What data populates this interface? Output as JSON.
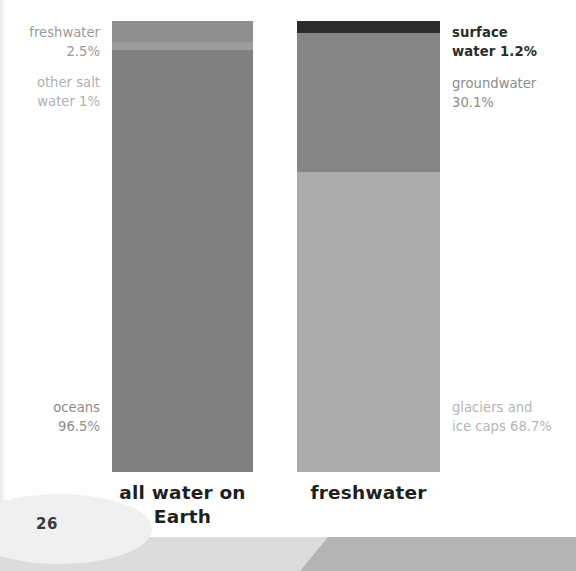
{
  "page": {
    "number": "26"
  },
  "chart_data": {
    "type": "bar",
    "title": "",
    "subtitle": "",
    "xlabel": "",
    "ylabel": "",
    "grid": false,
    "legend_position": "inline-labels",
    "orientation": "vertical-stacked",
    "ylim": [
      0,
      100
    ],
    "units": "percent",
    "categories": [
      "all water on Earth",
      "freshwater"
    ],
    "series": [
      {
        "name": "all water on Earth",
        "segments": [
          {
            "label": "freshwater",
            "value_label": "2.5%",
            "value": 2.5,
            "color": "#8f8f8f"
          },
          {
            "label": "other salt water",
            "value_label": "1%",
            "value": 1.0,
            "color": "#9a9a9a"
          },
          {
            "label": "oceans",
            "value_label": "96.5%",
            "value": 96.5,
            "color": "#808080"
          }
        ]
      },
      {
        "name": "freshwater",
        "segments": [
          {
            "label": "surface water",
            "value_label": "1.2%",
            "value": 1.2,
            "color": "#2b2b2b"
          },
          {
            "label": "groundwater",
            "value_label": "30.1%",
            "value": 30.1,
            "color": "#858585"
          },
          {
            "label": "glaciers and ice caps",
            "value_label": "68.7%",
            "value": 68.7,
            "color": "#acacac"
          }
        ]
      }
    ],
    "annotations": [
      {
        "name": "freshwater",
        "text": "freshwater\n2.5%",
        "color": "#9a9a9a",
        "bold": false
      },
      {
        "name": "other-salt-water",
        "text": "other salt\nwater 1%",
        "color": "#b0b0b0",
        "bold": false
      },
      {
        "name": "oceans",
        "text": "oceans\n96.5%",
        "color": "#8c8c8c",
        "bold": false
      },
      {
        "name": "surface-water",
        "text": "surface\nwater 1.2%",
        "color": "#2b2b2b",
        "bold": true
      },
      {
        "name": "groundwater",
        "text": "groundwater\n30.1%",
        "color": "#8c8c8c",
        "bold": false
      },
      {
        "name": "glaciers-ice-caps",
        "text": "glaciers and\nice caps 68.7%",
        "color": "#b5b5b5",
        "bold": false
      }
    ]
  },
  "bars": {
    "left": {
      "caption": "all water\non Earth",
      "segments": [
        {
          "name": "freshwater",
          "color": "#8f8f8f",
          "height_pct": 4.7
        },
        {
          "name": "other-salt-water",
          "color": "#9c9c9c",
          "height_pct": 1.8
        },
        {
          "name": "oceans",
          "color": "#808080",
          "height_pct": 93.5
        }
      ]
    },
    "right": {
      "caption": "freshwater",
      "segments": [
        {
          "name": "surface-water",
          "color": "#2b2b2b",
          "height_pct": 2.7
        },
        {
          "name": "groundwater",
          "color": "#858585",
          "height_pct": 30.8
        },
        {
          "name": "glaciers-ice-caps",
          "color": "#acacac",
          "height_pct": 66.5
        }
      ]
    }
  },
  "labels": {
    "freshwater": "freshwater\n2.5%",
    "other_salt_water": "other salt\nwater 1%",
    "oceans": "oceans\n96.5%",
    "surface_water": "surface\nwater 1.2%",
    "groundwater": "groundwater\n30.1%",
    "glaciers": "glaciers and\nice caps 68.7%"
  },
  "colors": {
    "page_background": "#ffffff",
    "bottom_band": "#dcdcdc",
    "bottom_wedge": "#b4b4b4",
    "page_number_text": "#3a3a3a"
  }
}
